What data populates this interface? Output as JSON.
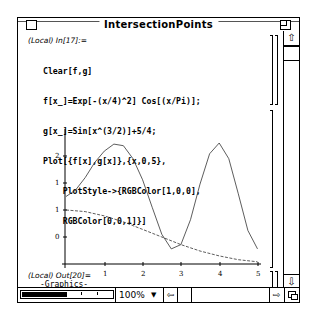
{
  "window": {
    "title": "IntersectionPoints"
  },
  "notebook": {
    "input_cell": {
      "label": "(Local) In[17]:=",
      "lines": [
        "Clear[f,g]",
        "f[x_]=Exp[-(x/4)^2] Cos[(x/Pi)];",
        "g[x_]=Sin[x^(3/2)]+5/4;",
        "Plot[{f[x],g[x]},{x,0,5},",
        "    PlotStyle->{RGBColor[1,0,0],",
        "    RGBColor[0,0,1]}]"
      ]
    },
    "output_cell": {
      "label": "(Local) Out[20]=",
      "value": "-Graphics-"
    }
  },
  "chart_data": {
    "type": "line",
    "title": "",
    "xlabel": "",
    "ylabel": "",
    "xlim": [
      0,
      5
    ],
    "ylim": [
      0,
      2.25
    ],
    "x_ticks": [
      "1",
      "2",
      "3",
      "4",
      "5"
    ],
    "y_ticks": [
      "0.5",
      "1",
      "1.5",
      "2"
    ],
    "y_tick_labels_visible": [
      "0",
      "1",
      "1",
      "2"
    ],
    "grid": false,
    "series": [
      {
        "name": "f[x] = Exp[-(x/4)^2] Cos[x/Pi]",
        "style": "dashed",
        "color": "#ff0000",
        "x": [
          0,
          0.5,
          1,
          1.5,
          2,
          2.5,
          3,
          3.5,
          4,
          4.5,
          5
        ],
        "values": [
          1.0,
          0.97,
          0.89,
          0.78,
          0.64,
          0.5,
          0.36,
          0.24,
          0.15,
          0.08,
          0.04
        ]
      },
      {
        "name": "g[x] = Sin[x^(3/2)] + 5/4",
        "style": "solid",
        "color": "#0000ff",
        "x": [
          0,
          0.25,
          0.5,
          0.75,
          1,
          1.25,
          1.5,
          1.75,
          2,
          2.25,
          2.5,
          2.75,
          3,
          3.25,
          3.5,
          3.75,
          4,
          4.25,
          4.5,
          4.75,
          5
        ],
        "values": [
          1.25,
          1.37,
          1.6,
          1.88,
          2.09,
          2.22,
          2.19,
          1.95,
          1.56,
          1.05,
          0.55,
          0.28,
          0.36,
          0.82,
          1.48,
          2.04,
          2.24,
          1.95,
          1.3,
          0.62,
          0.28
        ]
      }
    ]
  },
  "status_bar": {
    "zoom_level": "100%"
  },
  "icons": {
    "close": "close-box",
    "zoom": "zoom-box",
    "scroll_up": "⇧",
    "scroll_down": "⇩",
    "scroll_left": "⇦",
    "scroll_right": "⇨",
    "dropdown": "▼"
  }
}
